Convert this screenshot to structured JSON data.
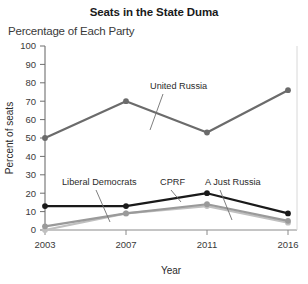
{
  "chart_data": {
    "type": "line",
    "title": "Seats in the State Duma",
    "subtitle": "Percentage of Each Party",
    "xlabel": "Year",
    "ylabel": "Percent of seats",
    "categories": [
      "2003",
      "2007",
      "2011",
      "2016"
    ],
    "x": [
      2003,
      2007,
      2011,
      2016
    ],
    "ylim": [
      0,
      100
    ],
    "yticks": [
      "0",
      "10",
      "20",
      "30",
      "40",
      "50",
      "60",
      "70",
      "80",
      "90",
      "100"
    ],
    "grid": false,
    "legend": "inline-labels",
    "series": [
      {
        "name": "United Russia",
        "values": [
          50,
          70,
          53,
          76
        ],
        "color": "#6b6b6b",
        "marker": "circle"
      },
      {
        "name": "CPRF",
        "values": [
          13,
          13,
          20,
          9
        ],
        "color": "#1a1a1a",
        "marker": "circle"
      },
      {
        "name": "Liberal Democrats",
        "values": [
          2,
          9,
          14,
          5
        ],
        "color": "#9a9a9a",
        "marker": "circle"
      },
      {
        "name": "A Just Russia",
        "values": [
          0,
          9,
          13,
          4
        ],
        "color": "#c0c0c0",
        "marker": "circle"
      }
    ],
    "annotations": [
      {
        "text": "United Russia",
        "series": "United Russia"
      },
      {
        "text": "Liberal Democrats",
        "series": "Liberal Democrats"
      },
      {
        "text": "CPRF",
        "series": "CPRF"
      },
      {
        "text": "A Just Russia",
        "series": "A Just Russia"
      }
    ]
  }
}
